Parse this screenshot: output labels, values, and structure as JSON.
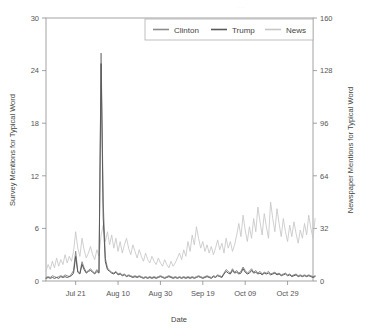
{
  "chart_data": {
    "type": "line",
    "title": "",
    "xlabel": "Date",
    "ylabel": "Survey Mentions for Typical Word",
    "y2label": "Newspaper Mentions for Typical Word",
    "ylim": [
      0,
      30
    ],
    "y2lim": [
      0,
      160
    ],
    "yticks": [
      0,
      6,
      12,
      18,
      24,
      30
    ],
    "y2ticks": [
      0,
      32,
      64,
      96,
      128,
      160
    ],
    "xtick_labels": [
      "Jul 21",
      "Aug 10",
      "Aug 30",
      "Sep 19",
      "Oct 09",
      "Oct 29"
    ],
    "xtick_indices": [
      14,
      34,
      54,
      74,
      94,
      114
    ],
    "x_index_range": [
      0,
      126
    ],
    "grid": false,
    "legend_position": "top-center-right",
    "series": [
      {
        "name": "Clinton",
        "axis": "left",
        "color": "#8c8c8c",
        "values": [
          0.4,
          0.5,
          0.4,
          0.6,
          0.5,
          0.4,
          0.5,
          0.6,
          0.5,
          0.7,
          0.6,
          0.5,
          0.8,
          1.2,
          3.4,
          1.1,
          0.9,
          2.2,
          1.5,
          1.0,
          1.2,
          1.4,
          1.1,
          0.9,
          1.3,
          1.0,
          26.0,
          9.0,
          2.6,
          1.5,
          1.2,
          1.0,
          0.9,
          1.1,
          0.8,
          0.9,
          0.7,
          0.8,
          0.6,
          0.7,
          0.6,
          0.5,
          0.6,
          0.5,
          0.6,
          0.5,
          0.4,
          0.5,
          0.4,
          0.5,
          0.4,
          0.5,
          0.4,
          0.5,
          0.6,
          0.5,
          0.4,
          0.5,
          0.6,
          0.5,
          0.4,
          0.5,
          0.4,
          0.5,
          0.4,
          0.5,
          0.4,
          0.5,
          0.4,
          0.5,
          0.4,
          0.5,
          0.6,
          0.5,
          0.4,
          0.5,
          0.6,
          0.5,
          0.4,
          0.6,
          0.5,
          0.7,
          0.6,
          0.5,
          0.9,
          1.3,
          1.1,
          0.9,
          1.4,
          1.0,
          1.2,
          0.9,
          1.1,
          1.6,
          1.2,
          0.9,
          1.1,
          1.4,
          1.0,
          1.2,
          0.9,
          1.1,
          0.8,
          1.0,
          0.9,
          1.1,
          0.8,
          0.9,
          1.0,
          0.8,
          0.9,
          0.7,
          0.8,
          0.9,
          0.7,
          0.8,
          0.6,
          0.7,
          0.8,
          0.6,
          0.7,
          0.6,
          0.7,
          0.6,
          0.7,
          0.6,
          0.5,
          0.6
        ]
      },
      {
        "name": "Trump",
        "axis": "left",
        "color": "#5a5a5a",
        "values": [
          0.3,
          0.4,
          0.3,
          0.4,
          0.3,
          0.4,
          0.3,
          0.5,
          0.4,
          0.5,
          0.4,
          0.5,
          0.6,
          0.9,
          2.8,
          1.0,
          0.8,
          1.9,
          1.3,
          0.9,
          1.1,
          1.2,
          1.0,
          0.8,
          1.1,
          0.9,
          24.8,
          7.2,
          2.2,
          1.3,
          1.1,
          0.9,
          0.8,
          1.0,
          0.7,
          0.8,
          0.6,
          0.7,
          0.5,
          0.6,
          0.5,
          0.4,
          0.5,
          0.4,
          0.5,
          0.4,
          0.3,
          0.4,
          0.3,
          0.4,
          0.3,
          0.4,
          0.3,
          0.4,
          0.5,
          0.4,
          0.3,
          0.4,
          0.5,
          0.4,
          0.3,
          0.4,
          0.3,
          0.4,
          0.3,
          0.4,
          0.3,
          0.4,
          0.3,
          0.4,
          0.3,
          0.4,
          0.5,
          0.4,
          0.3,
          0.4,
          0.5,
          0.4,
          0.3,
          0.5,
          0.4,
          0.6,
          0.5,
          0.4,
          0.8,
          1.1,
          0.9,
          0.8,
          1.2,
          0.9,
          1.0,
          0.8,
          0.9,
          1.4,
          1.0,
          0.8,
          0.9,
          1.2,
          0.9,
          1.0,
          0.8,
          0.9,
          0.7,
          0.9,
          0.8,
          0.9,
          0.7,
          0.8,
          0.9,
          0.7,
          0.8,
          0.6,
          0.7,
          0.8,
          0.6,
          0.7,
          0.5,
          0.6,
          0.7,
          0.5,
          0.6,
          0.5,
          0.6,
          0.5,
          0.6,
          0.5,
          0.4,
          0.5
        ]
      },
      {
        "name": "News",
        "axis": "right",
        "color": "#c6c6c6",
        "values": [
          6,
          10,
          7,
          12,
          8,
          14,
          9,
          13,
          10,
          16,
          11,
          15,
          12,
          18,
          30,
          20,
          15,
          26,
          19,
          14,
          17,
          21,
          16,
          13,
          19,
          15,
          28,
          34,
          24,
          30,
          22,
          28,
          20,
          26,
          18,
          24,
          17,
          22,
          26,
          20,
          16,
          22,
          18,
          14,
          19,
          15,
          12,
          17,
          13,
          11,
          15,
          12,
          10,
          14,
          11,
          9,
          13,
          10,
          8,
          12,
          9,
          11,
          14,
          17,
          13,
          19,
          15,
          24,
          18,
          28,
          22,
          33,
          26,
          20,
          24,
          18,
          22,
          17,
          21,
          16,
          20,
          25,
          19,
          23,
          17,
          26,
          20,
          24,
          18,
          22,
          28,
          35,
          27,
          40,
          31,
          24,
          33,
          26,
          38,
          30,
          45,
          36,
          28,
          41,
          33,
          26,
          48,
          38,
          30,
          44,
          35,
          27,
          38,
          30,
          24,
          34,
          27,
          36,
          29,
          23,
          31,
          26,
          35,
          28,
          40,
          32,
          26,
          38
        ]
      }
    ]
  },
  "legend": {
    "items": [
      {
        "label": "Clinton"
      },
      {
        "label": "Trump"
      },
      {
        "label": "News"
      }
    ]
  },
  "axes": {
    "left": {
      "title": "Survey Mentions for Typical Word"
    },
    "right": {
      "title": "Newspaper Mentions for Typical Word"
    },
    "bottom": {
      "title": "Date"
    }
  }
}
